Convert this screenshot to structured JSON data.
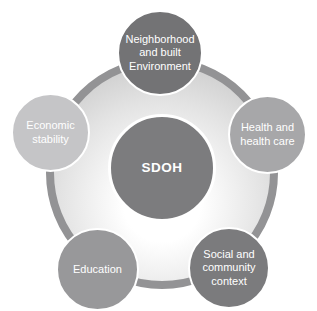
{
  "diagram": {
    "center": {
      "label": "SDOH",
      "color": "#7c7c7e",
      "text_color": "#ffffff"
    },
    "nodes": [
      {
        "id": "neighborhood",
        "label": "Neighborhood\nand built\nEnvironment",
        "color": "#737375"
      },
      {
        "id": "economic",
        "label": "Economic\nstability",
        "color": "#c5c5c7"
      },
      {
        "id": "health",
        "label": "Health and\nhealth care",
        "color": "#a7a7a9"
      },
      {
        "id": "education",
        "label": "Education",
        "color": "#98989a"
      },
      {
        "id": "social",
        "label": "Social and\ncommunity\ncontext",
        "color": "#7b7b7d"
      }
    ],
    "ring": {
      "border_color": "#939395",
      "inner_gradient": [
        "#ffffff",
        "#e3e3e3",
        "#bfbfbf"
      ]
    }
  }
}
